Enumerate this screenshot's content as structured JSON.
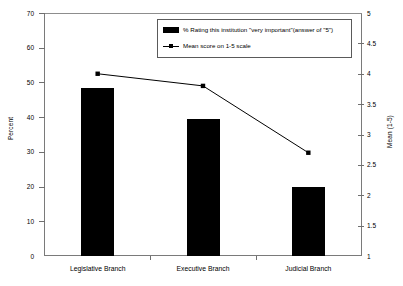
{
  "chart_data": {
    "type": "bar",
    "title": "",
    "subtitle": "",
    "categories": [
      "Legislative Branch",
      "Executive Branch",
      "Judicial Branch"
    ],
    "series": [
      {
        "name": "% Rating this institution \"very important\"(answer of \"5\")",
        "type": "bar",
        "axis": "left",
        "values": [
          48.5,
          39.5,
          20.0
        ]
      },
      {
        "name": "Mean score on 1-5 scale",
        "type": "line",
        "axis": "right",
        "values": [
          4.0,
          3.8,
          2.7
        ]
      }
    ],
    "xlabel": "",
    "ylabel": "Percent",
    "y2label": "Mean (1-5)",
    "ylim": [
      0,
      70
    ],
    "y2lim": [
      1,
      5
    ],
    "yticks": [
      0,
      10,
      20,
      30,
      40,
      50,
      60,
      70
    ],
    "yticklabels": [
      "0",
      "10",
      "20",
      "30",
      "40",
      "50",
      "60",
      "70"
    ],
    "y2ticks": [
      1,
      1.5,
      2,
      2.5,
      3,
      3.5,
      4,
      4.5,
      5
    ],
    "y2ticklabels": [
      "1",
      "1.5",
      "2",
      "2.5",
      "3",
      "3.5",
      "4",
      "4.5",
      "5"
    ],
    "grid": false,
    "legend_position": "top-center",
    "bar_color": "#000000",
    "line_color": "#000000",
    "marker": "square",
    "background": "#ffffff",
    "frame_color": "#7a7a7a"
  },
  "axes": {
    "left_title": "Percent",
    "right_title": "Mean (1-5)"
  },
  "legend": {
    "entries": [
      {
        "label": "% Rating this institution \"very important\"(answer of \"5\")",
        "marker": "bar-swatch"
      },
      {
        "label": "Mean score on 1-5 scale",
        "marker": "line-square-swatch"
      }
    ]
  }
}
